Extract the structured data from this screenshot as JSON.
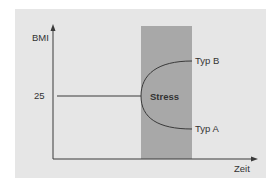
{
  "diagram": {
    "y_axis_label": "BMI",
    "x_axis_label": "Zeit",
    "baseline_value": "25",
    "stress_region_label": "Stress",
    "branches": [
      {
        "label": "Typ B",
        "direction": "up"
      },
      {
        "label": "Typ A",
        "direction": "down"
      }
    ],
    "colors": {
      "panel": "#e6e6e6",
      "stress_region": "#a8a8a8",
      "lines": "#3a3a3a"
    }
  }
}
